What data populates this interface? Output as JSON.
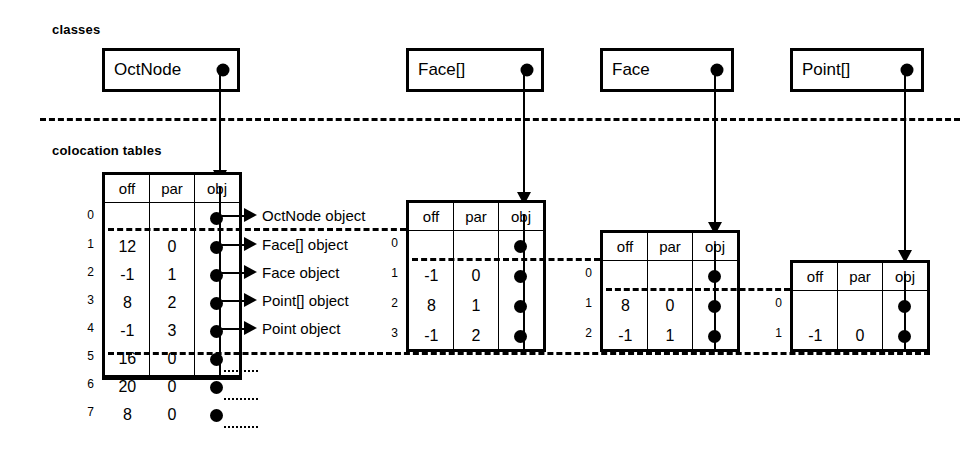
{
  "labels": {
    "classes": "classes",
    "colocation_tables": "colocation tables"
  },
  "class_boxes": [
    {
      "name": "OctNode",
      "dot": "filled-dot"
    },
    {
      "name": "Face[]",
      "dot": "filled-dot"
    },
    {
      "name": "Face",
      "dot": "filled-dot"
    },
    {
      "name": "Point[]",
      "dot": "filled-dot"
    }
  ],
  "columns": [
    "off",
    "par",
    "obj"
  ],
  "tables": [
    {
      "id": "octnode-table",
      "columns": [
        "off",
        "par",
        "obj"
      ],
      "rows": [
        {
          "index": "0",
          "off": "",
          "par": "",
          "obj": "filled-dot"
        },
        {
          "index": "1",
          "off": "12",
          "par": "0",
          "obj": "filled-dot"
        },
        {
          "index": "2",
          "off": "-1",
          "par": "1",
          "obj": "filled-dot"
        },
        {
          "index": "3",
          "off": "8",
          "par": "2",
          "obj": "filled-dot"
        },
        {
          "index": "4",
          "off": "-1",
          "par": "3",
          "obj": "filled-dot"
        },
        {
          "index": "5",
          "off": "16",
          "par": "0",
          "obj": "filled-dot"
        },
        {
          "index": "6",
          "off": "20",
          "par": "0",
          "obj": "filled-dot"
        },
        {
          "index": "7",
          "off": "8",
          "par": "0",
          "obj": "filled-dot"
        }
      ]
    },
    {
      "id": "face-array-table",
      "columns": [
        "off",
        "par",
        "obj"
      ],
      "rows": [
        {
          "index": "0",
          "off": "",
          "par": "",
          "obj": "filled-dot"
        },
        {
          "index": "1",
          "off": "-1",
          "par": "0",
          "obj": "filled-dot"
        },
        {
          "index": "2",
          "off": "8",
          "par": "1",
          "obj": "filled-dot"
        },
        {
          "index": "3",
          "off": "-1",
          "par": "2",
          "obj": "filled-dot"
        }
      ]
    },
    {
      "id": "face-table",
      "columns": [
        "off",
        "par",
        "obj"
      ],
      "rows": [
        {
          "index": "0",
          "off": "",
          "par": "",
          "obj": "filled-dot"
        },
        {
          "index": "1",
          "off": "8",
          "par": "0",
          "obj": "filled-dot"
        },
        {
          "index": "2",
          "off": "-1",
          "par": "1",
          "obj": "filled-dot"
        }
      ]
    },
    {
      "id": "point-array-table",
      "columns": [
        "off",
        "par",
        "obj"
      ],
      "rows": [
        {
          "index": "0",
          "off": "",
          "par": "",
          "obj": "filled-dot"
        },
        {
          "index": "1",
          "off": "-1",
          "par": "0",
          "obj": "filled-dot"
        }
      ]
    }
  ],
  "object_labels": [
    "OctNode object",
    "Face[] object",
    "Face object",
    "Point[] object",
    "Point object"
  ],
  "colors": {
    "line": "#000000",
    "background": "#ffffff"
  }
}
